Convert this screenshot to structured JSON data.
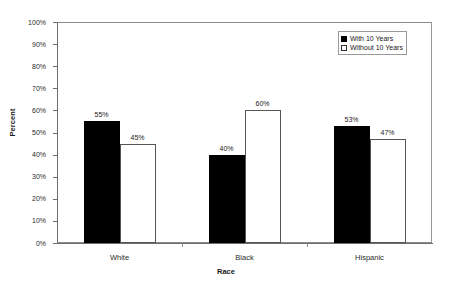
{
  "chart_data": {
    "type": "bar",
    "title": "",
    "xlabel": "Race",
    "ylabel": "Percent",
    "categories": [
      "White",
      "Black",
      "Hispanic"
    ],
    "series": [
      {
        "name": "With 10 Years",
        "values": [
          55,
          40,
          53
        ],
        "style": "filled",
        "color": "#000000"
      },
      {
        "name": "Without 10 Years",
        "values": [
          45,
          60,
          47
        ],
        "style": "hollow",
        "color": "#ffffff"
      }
    ],
    "value_labels": [
      [
        "55%",
        "45%"
      ],
      [
        "40%",
        "60%"
      ],
      [
        "53%",
        "47%"
      ]
    ],
    "ylim": [
      0,
      100
    ],
    "ytick_values": [
      100,
      90,
      80,
      70,
      60,
      50,
      40,
      30,
      20,
      10,
      0
    ],
    "ytick_labels": [
      "100%",
      "90%",
      "80%",
      "70%",
      "60%",
      "50%",
      "40%",
      "30%",
      "20%",
      "10%",
      "0%"
    ],
    "grid": false,
    "legend_position": "top-right",
    "legend": [
      {
        "label": "With 10 Years",
        "style": "filled"
      },
      {
        "label": "Without 10 Years",
        "style": "hollow"
      }
    ]
  },
  "axis": {
    "y_label": "Percent",
    "x_label": "Race"
  }
}
